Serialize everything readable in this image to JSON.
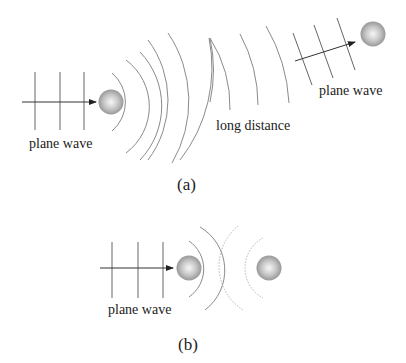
{
  "figure": {
    "panel_a": {
      "caption": "(a)",
      "incident_label": "plane wave",
      "middle_label": "long distance",
      "far_label": "plane wave"
    },
    "panel_b": {
      "caption": "(b)",
      "incident_label": "plane wave"
    },
    "colors": {
      "line": "#666666",
      "arc": "#8a8a8a",
      "dotted_arc": "#b5b5b5",
      "sphere_light": "#f5f5f5",
      "sphere_dark": "#8c8c8c",
      "text": "#222222"
    }
  }
}
